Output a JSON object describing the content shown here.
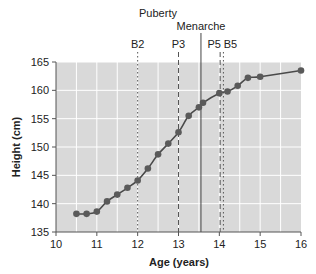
{
  "chart_data": {
    "type": "scatter",
    "title": "",
    "xlabel": "Age (years)",
    "ylabel": "Height (cm)",
    "xlim": [
      10,
      16
    ],
    "ylim": [
      135,
      165
    ],
    "x_ticks": [
      10,
      11,
      12,
      13,
      14,
      15,
      16
    ],
    "y_ticks": [
      135,
      140,
      145,
      150,
      155,
      160,
      165
    ],
    "grid": true,
    "background_color": "#d9d9d9",
    "grid_color": "#ffffff",
    "point_color": "#5a5a5a",
    "line_color": "#4a4a4a",
    "series": [
      {
        "name": "Height",
        "fit": "smooth sigmoid curve",
        "points": [
          {
            "x": 10.5,
            "y": 138.2
          },
          {
            "x": 10.75,
            "y": 138.2
          },
          {
            "x": 11.0,
            "y": 138.6
          },
          {
            "x": 11.25,
            "y": 140.4
          },
          {
            "x": 11.5,
            "y": 141.6
          },
          {
            "x": 11.75,
            "y": 142.8
          },
          {
            "x": 12.0,
            "y": 144.1
          },
          {
            "x": 12.25,
            "y": 146.2
          },
          {
            "x": 12.5,
            "y": 148.7
          },
          {
            "x": 12.75,
            "y": 150.6
          },
          {
            "x": 13.0,
            "y": 152.6
          },
          {
            "x": 13.25,
            "y": 155.5
          },
          {
            "x": 13.5,
            "y": 157.0
          },
          {
            "x": 13.6,
            "y": 157.8
          },
          {
            "x": 14.0,
            "y": 159.5
          },
          {
            "x": 14.2,
            "y": 159.8
          },
          {
            "x": 14.45,
            "y": 160.8
          },
          {
            "x": 14.7,
            "y": 162.2
          },
          {
            "x": 15.0,
            "y": 162.4
          },
          {
            "x": 16.0,
            "y": 163.5
          }
        ]
      }
    ],
    "annotations": [
      {
        "label": "Puberty",
        "type": "group-heading"
      },
      {
        "label": "B2",
        "x": 12.0,
        "style": "dotted"
      },
      {
        "label": "P3",
        "x": 13.0,
        "style": "dashed"
      },
      {
        "label": "Menarche",
        "x": 13.55,
        "style": "solid"
      },
      {
        "label": "P5",
        "x": 14.02,
        "style": "dashed"
      },
      {
        "label": "B5",
        "x": 14.1,
        "style": "dotted"
      }
    ]
  }
}
